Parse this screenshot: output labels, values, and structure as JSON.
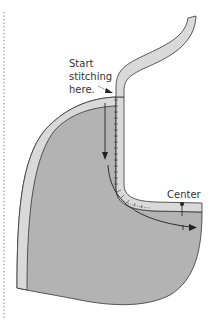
{
  "labels": {
    "start_line1": "Start",
    "start_line2": "stitching",
    "start_line3": "here.",
    "center": "Center"
  },
  "colors": {
    "body_fill": "#b3b3b3",
    "facing_fill": "#d9d9d9",
    "outline": "#333333",
    "fold_line": "#999999"
  },
  "icons": {
    "start_pointer": "arrow-pointer-icon",
    "direction_arrow": "down-then-right-arrow-icon",
    "center_marker": "pin-marker-icon"
  }
}
